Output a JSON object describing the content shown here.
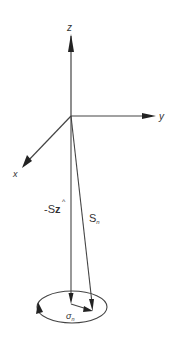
{
  "diagram": {
    "type": "3d-coordinate-vector-diagram",
    "stroke_color": "#444444",
    "axes": {
      "z": {
        "label": "z"
      },
      "y": {
        "label": "y"
      },
      "x": {
        "label": "x"
      }
    },
    "vectors": {
      "neg_s_z": {
        "label_prefix": "-S",
        "label_main": "z",
        "label_hat": "^"
      },
      "s_n": {
        "label_main": "S",
        "label_sub": "n"
      },
      "sigma_n": {
        "label_main": "σ",
        "label_sub": "n"
      }
    }
  }
}
